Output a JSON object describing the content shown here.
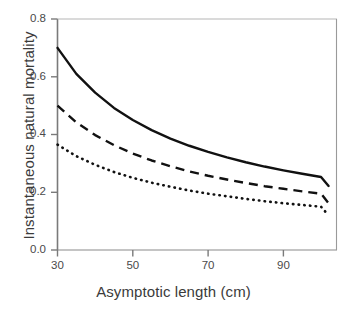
{
  "chart_data": {
    "type": "line",
    "title": "",
    "subtitle": "",
    "xlabel": "Asymptotic length (cm)",
    "ylabel": "Instantaneous natural mortality",
    "xlim": [
      27,
      102
    ],
    "ylim": [
      0.0,
      0.8
    ],
    "xticks": [
      30,
      50,
      70,
      90
    ],
    "xtick_labels": [
      "30",
      "50",
      "70",
      "90"
    ],
    "yticks": [
      0.0,
      0.2,
      0.4,
      0.6,
      0.8
    ],
    "ytick_labels": [
      "0.0",
      "0.2",
      "0.4",
      "0.6",
      "0.8"
    ],
    "grid": false,
    "legend": "none",
    "axis_color": "#6b6b6b",
    "line_color": "#111111",
    "x": [
      30,
      35,
      40,
      45,
      50,
      55,
      60,
      65,
      70,
      75,
      80,
      85,
      90,
      95,
      100,
      102
    ],
    "series": [
      {
        "name": "upper-curve",
        "style": "solid",
        "values": [
          0.7,
          0.61,
          0.545,
          0.492,
          0.45,
          0.415,
          0.386,
          0.361,
          0.34,
          0.321,
          0.304,
          0.289,
          0.276,
          0.264,
          0.253,
          0.222
        ]
      },
      {
        "name": "middle-curve",
        "style": "dashed",
        "values": [
          0.5,
          0.442,
          0.398,
          0.363,
          0.334,
          0.31,
          0.29,
          0.272,
          0.257,
          0.244,
          0.232,
          0.221,
          0.212,
          0.203,
          0.195,
          0.162
        ]
      },
      {
        "name": "lower-curve",
        "style": "dotted",
        "values": [
          0.365,
          0.325,
          0.295,
          0.27,
          0.25,
          0.233,
          0.219,
          0.206,
          0.195,
          0.186,
          0.177,
          0.169,
          0.162,
          0.156,
          0.15,
          0.12
        ]
      }
    ]
  },
  "axes": {
    "x_title": "Asymptotic length (cm)",
    "y_title": "Instantaneous natural mortality"
  },
  "ticks": {
    "y": [
      "0.8",
      "0.6",
      "0.4",
      "0.2",
      "0.0"
    ],
    "x": [
      "30",
      "50",
      "70",
      "90"
    ]
  }
}
